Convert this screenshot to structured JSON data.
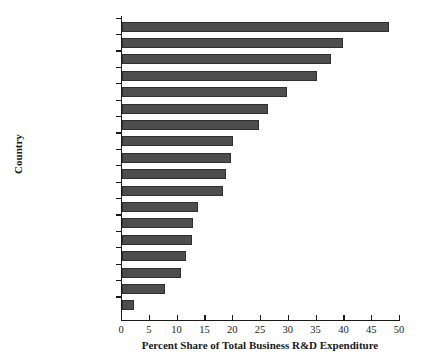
{
  "chart_data": {
    "type": "bar",
    "orientation": "horizontal",
    "title": "",
    "xlabel": "Percent Share of Total Business R&D Expenditure",
    "ylabel": "Country",
    "xlim": [
      0,
      50
    ],
    "xticks": [
      0,
      5,
      10,
      15,
      20,
      25,
      30,
      35,
      40,
      45,
      50
    ],
    "grid": false,
    "legend": null,
    "bar_color": "#4d4d4d",
    "bar_edge_color": "#2f2f2f",
    "categories": [
      "Norway",
      "Australia",
      "Spain",
      "Denmark",
      "Czech Republic",
      "Canada",
      "Ireland",
      "Italy",
      "Netherlands",
      "United Kingdom",
      "Poland",
      "Belgium",
      "Korea",
      "Finland",
      "Sweden",
      "France",
      "Germany",
      "Japan"
    ],
    "values": [
      48.0,
      39.8,
      37.5,
      35.1,
      29.6,
      26.3,
      24.6,
      19.9,
      19.6,
      18.7,
      18.2,
      13.7,
      12.7,
      12.5,
      11.5,
      10.7,
      7.8,
      2.2
    ]
  }
}
